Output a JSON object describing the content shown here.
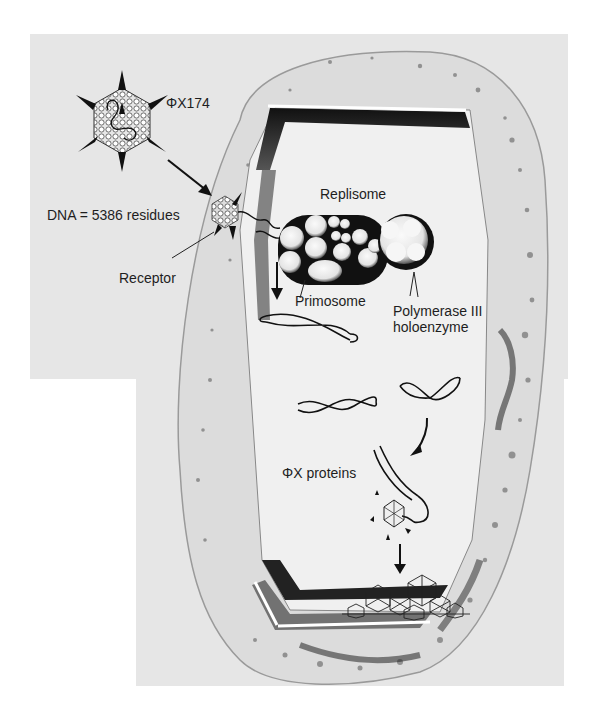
{
  "figure": {
    "background_color": "#e6e6e6",
    "cell_interior_color": "#ececec",
    "ink_color": "#1e1e1e"
  },
  "labels": {
    "phage_name": "ΦX174",
    "dna_size": "DNA = 5386 residues",
    "receptor": "Receptor",
    "replisome": "Replisome",
    "primosome": "Primosome",
    "polymerase_line1": "Polymerase III",
    "polymerase_line2": "holoenzyme",
    "phix_proteins": "ΦX proteins"
  },
  "elements": {
    "phage_particle": "icosahedral-virion-with-spikes",
    "infection_arrow": "arrow-to-receptor",
    "host_cell": "bacterial-cell-wall-cutaway",
    "replisome_complex": "sphere-cluster",
    "rf_dna_molecules": 4,
    "assembling_virion": "icosahedron",
    "progeny_virions": "icosahedron-pile"
  }
}
